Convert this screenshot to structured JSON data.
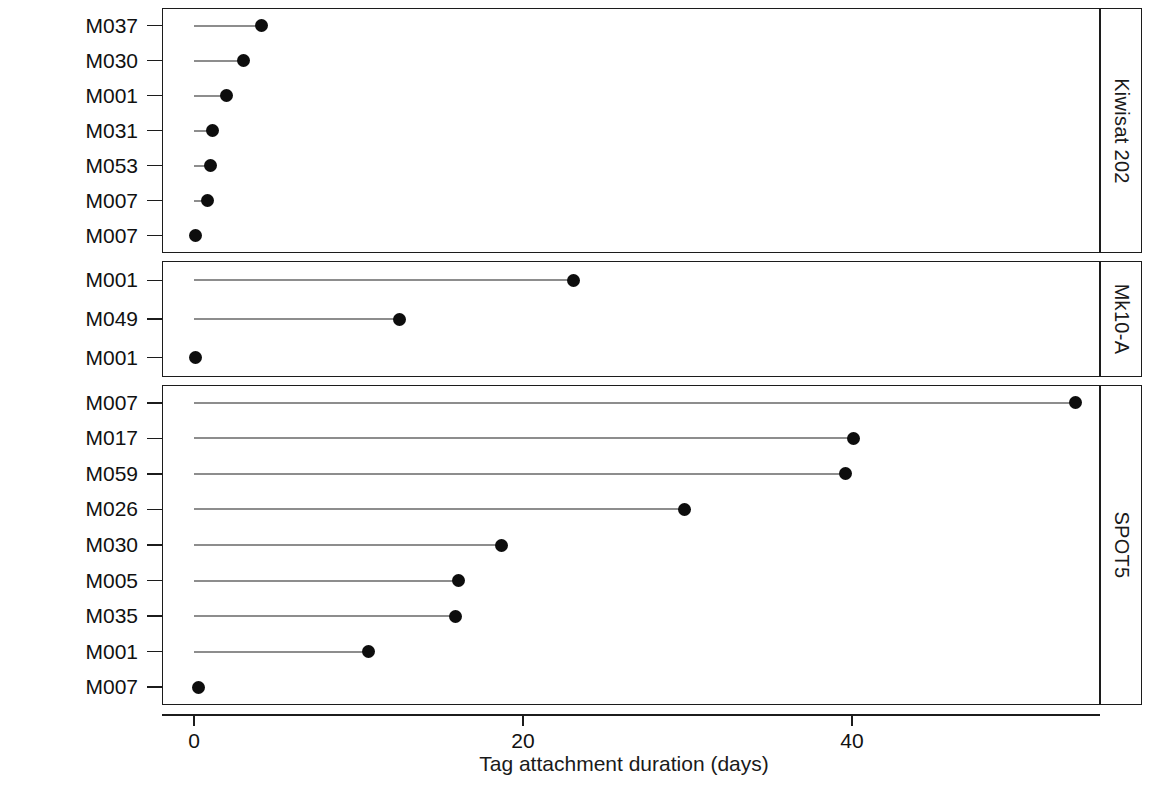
{
  "chart_data": {
    "type": "scatter",
    "title": "",
    "subtitle": "",
    "xlabel": "Tag attachment duration (days)",
    "ylabel": "Individual",
    "xlim": [
      -1.5,
      57.5
    ],
    "xticks": [
      0,
      20,
      40
    ],
    "xticklabels": [
      "0",
      "20",
      "40"
    ],
    "grid": false,
    "legend": "none",
    "style": "lollipop / dot plot with stem lines from 0",
    "facet_label_position": "right",
    "panels": [
      {
        "facet": "Kiwisat 202",
        "categories": [
          "M037",
          "M030",
          "M001",
          "M031",
          "M053",
          "M007",
          "M007"
        ],
        "values": [
          4.1,
          3.0,
          2.0,
          1.1,
          1.0,
          0.8,
          0.1
        ]
      },
      {
        "facet": "Mk10-A",
        "categories": [
          "M001",
          "M049",
          "M001"
        ],
        "values": [
          23.1,
          12.5,
          0.1
        ]
      },
      {
        "facet": "SPOT5",
        "categories": [
          "M007",
          "M017",
          "M059",
          "M026",
          "M030",
          "M005",
          "M035",
          "M001",
          "M007"
        ],
        "values": [
          53.6,
          40.1,
          39.6,
          29.8,
          18.7,
          16.1,
          15.9,
          10.6,
          0.3
        ]
      }
    ]
  },
  "axes": {
    "x": {
      "title": "Tag attachment duration (days)",
      "ticks": [
        "0",
        "20",
        "40"
      ]
    },
    "y": {
      "title": "Individual"
    }
  },
  "colors": {
    "point": "#0d0d0d",
    "stem": "#8d8d8d",
    "frame": "#1c1c1c",
    "background": "#ffffff",
    "text": "#111111"
  }
}
